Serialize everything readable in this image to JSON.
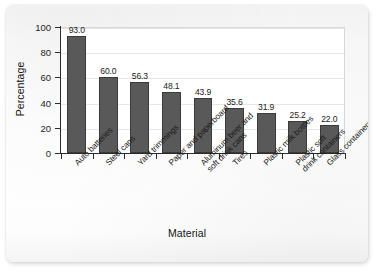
{
  "chart_data": {
    "type": "bar",
    "title": "",
    "xlabel": "Material",
    "ylabel": "Percentage",
    "ylim": [
      0,
      100
    ],
    "yticks": [
      0,
      20,
      40,
      60,
      80,
      100
    ],
    "ytick_labels": [
      "0",
      "20",
      "40",
      "60",
      "80",
      "100"
    ],
    "grid": true,
    "grid_axis": "y",
    "legend": false,
    "bar_color": "#595959",
    "bar_edge_color": "#3a3a3a",
    "value_label_format": "one-decimal",
    "categories": [
      "Auto batteries",
      "Steel cans",
      "Yard trimmings",
      "Paper and paperboard",
      "Aluminum beer and soft drink cans",
      "Tires",
      "Plastic milk bottles",
      "Plastic soft drink containers",
      "Glass containers"
    ],
    "category_lines": [
      [
        "Auto batteries"
      ],
      [
        "Steel cans"
      ],
      [
        "Yard trimmings"
      ],
      [
        "Paper and paperboard"
      ],
      [
        "Aluminum beer and",
        "soft drink cans"
      ],
      [
        "Tires"
      ],
      [
        "Plastic milk bottles"
      ],
      [
        "Plastic soft",
        "drink containers"
      ],
      [
        "Glass containers"
      ]
    ],
    "values": [
      93.0,
      60.0,
      56.3,
      48.1,
      43.9,
      35.6,
      31.9,
      25.2,
      22.0
    ],
    "value_labels": [
      "93.0",
      "60.0",
      "56.3",
      "48.1",
      "43.9",
      "35.6",
      "31.9",
      "25.2",
      "22.0"
    ]
  }
}
